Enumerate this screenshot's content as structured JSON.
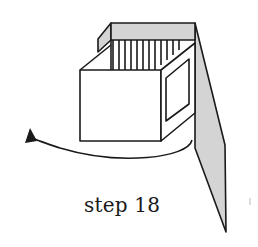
{
  "diagram": {
    "caption": "step 18",
    "colors": {
      "stroke": "#1a1a1a",
      "shade": "#d4d4d4",
      "background": "#ffffff"
    },
    "elements": [
      "open-box",
      "slatted-back-panel",
      "side-window",
      "long-shaded-flap",
      "rotation-arrow"
    ]
  }
}
